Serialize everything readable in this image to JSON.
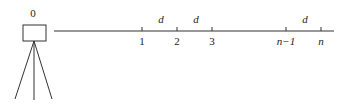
{
  "diagram": {
    "type": "survey-leveling-diagram",
    "instrument": {
      "label": "0",
      "icon": "tripod-instrument-icon"
    },
    "baseline": {
      "points": [
        {
          "label": "1",
          "italic": false
        },
        {
          "label": "2",
          "italic": false
        },
        {
          "label": "3",
          "italic": false
        },
        {
          "label": "n−1",
          "italic": true
        },
        {
          "label": "n",
          "italic": true
        }
      ],
      "spacing_labels": [
        {
          "text": "d",
          "between": "1-2"
        },
        {
          "text": "d",
          "between": "2-3"
        },
        {
          "text": "d",
          "between": "n-1 to n"
        }
      ]
    },
    "colors": {
      "stroke": "#333333",
      "text": "#222222",
      "background": "#ffffff"
    }
  }
}
